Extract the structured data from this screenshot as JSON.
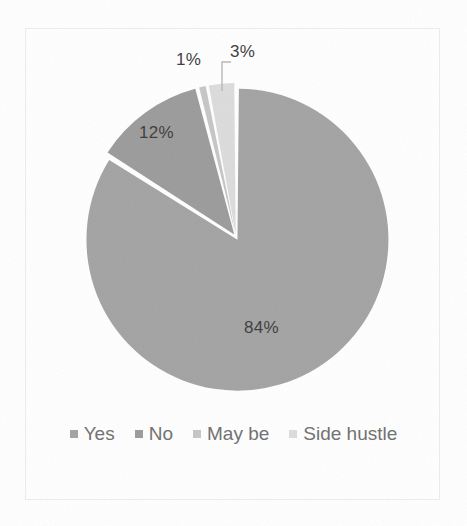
{
  "figure": {
    "background_color": "#ffffff",
    "border_color": "#ededed"
  },
  "chart_data": {
    "type": "pie",
    "title": "",
    "subtitle": "",
    "categories": [
      "Yes",
      "No",
      "May be",
      "Side hustle"
    ],
    "values": [
      84,
      12,
      1,
      3
    ],
    "value_unit": "%",
    "data_labels": [
      "84%",
      "12%",
      "1%",
      "3%"
    ],
    "colors": [
      "#a3a3a3",
      "#9b9b9b",
      "#c6c6c6",
      "#dcdcdc"
    ],
    "legend": {
      "position": "bottom",
      "entries": [
        {
          "label": "Yes",
          "color": "#a3a3a3"
        },
        {
          "label": "No",
          "color": "#9b9b9b"
        },
        {
          "label": "May be",
          "color": "#c6c6c6"
        },
        {
          "label": "Side hustle",
          "color": "#dcdcdc"
        }
      ]
    },
    "start_angle_deg": 0,
    "direction": "clockwise",
    "exploded": true,
    "grid": false,
    "xlabel": "",
    "ylabel": ""
  },
  "labels": {
    "yes_pct": "84%",
    "no_pct": "12%",
    "maybe_pct": "1%",
    "side_hustle_pct": "3%"
  },
  "legend": {
    "items": [
      {
        "label": "Yes"
      },
      {
        "label": "No"
      },
      {
        "label": "May be"
      },
      {
        "label": "Side hustle"
      }
    ]
  }
}
